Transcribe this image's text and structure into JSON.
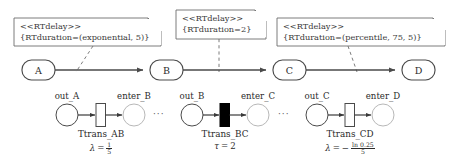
{
  "diagram": {
    "stroke_color": "#4a4a4a",
    "text_color": "#2b2b2b",
    "fill_white": "#ffffff",
    "fill_black": "#000000"
  },
  "notes": [
    {
      "id": "note-exponential",
      "stereotype": "<<RTdelay>>",
      "tag": "{RTduration=(exponential, 5)}"
    },
    {
      "id": "note-constant",
      "stereotype": "<<RTdelay>>",
      "tag": "{RTduration=2}"
    },
    {
      "id": "note-percentile",
      "stereotype": "<<RTdelay>>",
      "tag": "{RTduration=(percentile, 75, 5)}"
    }
  ],
  "states": [
    {
      "id": "state-a",
      "label": "A"
    },
    {
      "id": "state-b",
      "label": "B"
    },
    {
      "id": "state-c",
      "label": "C"
    },
    {
      "id": "state-d",
      "label": "D"
    }
  ],
  "petri": {
    "groups": [
      {
        "id": "group-ab",
        "source_place": "out_A",
        "target_place": "enter_B",
        "transition_name": "Ttrans_AB",
        "transition_fill": "white",
        "rate_symbol": "λ",
        "rate_equals": "=",
        "rate_sign": "",
        "rate_numerator": "1",
        "rate_denominator": "5",
        "rate_plain": "λ = 1/5"
      },
      {
        "id": "group-bc",
        "source_place": "out_B",
        "target_place": "enter_C",
        "transition_name": "Ttrans_BC",
        "transition_fill": "black",
        "rate_symbol": "τ",
        "rate_equals": "=",
        "rate_sign": "",
        "rate_numerator": "",
        "rate_denominator": "",
        "rate_plain": "τ = 2",
        "rate_value": "2"
      },
      {
        "id": "group-cd",
        "source_place": "out_C",
        "target_place": "enter_D",
        "transition_name": "Ttrans_CD",
        "transition_fill": "white",
        "rate_symbol": "λ",
        "rate_equals": "=",
        "rate_sign": "−",
        "rate_numerator": "ln 0.25",
        "rate_denominator": "5",
        "rate_plain": "λ = − ln 0.25 / 5"
      }
    ],
    "separator": "···"
  }
}
